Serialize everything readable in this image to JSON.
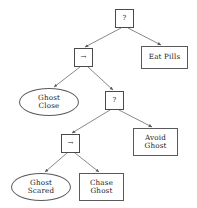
{
  "diagram": {
    "type": "behavior-tree",
    "title": "",
    "nodes": [
      {
        "id": "root-selector",
        "kind": "operator",
        "shape": "box",
        "glyph": "?",
        "glyph_name": "question-mark",
        "lines": [
          "?"
        ],
        "x": 115,
        "y": 9,
        "w": 19,
        "h": 19
      },
      {
        "id": "sequence-1",
        "kind": "operator",
        "shape": "box",
        "glyph": "→",
        "glyph_name": "right-arrow",
        "lines": [
          "→"
        ],
        "x": 74,
        "y": 48,
        "w": 19,
        "h": 19
      },
      {
        "id": "eat-pills",
        "kind": "action",
        "shape": "rect",
        "lines": [
          "Eat Pills"
        ],
        "x": 141,
        "y": 46,
        "w": 47,
        "h": 23
      },
      {
        "id": "ghost-close",
        "kind": "condition",
        "shape": "ellipse",
        "lines": [
          "Ghost",
          "Close"
        ],
        "x": 19,
        "y": 88,
        "w": 60,
        "h": 28
      },
      {
        "id": "selector-2",
        "kind": "operator",
        "shape": "box",
        "glyph": "?",
        "glyph_name": "question-mark",
        "lines": [
          "?"
        ],
        "x": 105,
        "y": 91,
        "w": 19,
        "h": 19
      },
      {
        "id": "sequence-2",
        "kind": "operator",
        "shape": "box",
        "glyph": "→",
        "glyph_name": "right-arrow",
        "lines": [
          "→"
        ],
        "x": 61,
        "y": 134,
        "w": 19,
        "h": 19
      },
      {
        "id": "avoid-ghost",
        "kind": "action",
        "shape": "rect",
        "lines": [
          "Avoid",
          "Ghost"
        ],
        "x": 133,
        "y": 128,
        "w": 45,
        "h": 28
      },
      {
        "id": "ghost-scared",
        "kind": "condition",
        "shape": "ellipse",
        "lines": [
          "Ghost",
          "Scared"
        ],
        "x": 11,
        "y": 173,
        "w": 60,
        "h": 28
      },
      {
        "id": "chase-ghost",
        "kind": "action",
        "shape": "rect",
        "lines": [
          "Chase",
          "Ghost"
        ],
        "x": 79,
        "y": 173,
        "w": 45,
        "h": 28
      }
    ],
    "edges": [
      {
        "from": "root-selector",
        "to": "sequence-1",
        "x1": 121,
        "y1": 28,
        "x2": 85,
        "y2": 47
      },
      {
        "from": "root-selector",
        "to": "eat-pills",
        "x1": 128,
        "y1": 28,
        "x2": 161,
        "y2": 45
      },
      {
        "from": "sequence-1",
        "to": "ghost-close",
        "x1": 80,
        "y1": 67,
        "x2": 54,
        "y2": 87
      },
      {
        "from": "sequence-1",
        "to": "selector-2",
        "x1": 88,
        "y1": 67,
        "x2": 113,
        "y2": 90
      },
      {
        "from": "selector-2",
        "to": "sequence-2",
        "x1": 110,
        "y1": 110,
        "x2": 72,
        "y2": 133
      },
      {
        "from": "selector-2",
        "to": "avoid-ghost",
        "x1": 119,
        "y1": 110,
        "x2": 152,
        "y2": 127
      },
      {
        "from": "sequence-2",
        "to": "ghost-scared",
        "x1": 67,
        "y1": 153,
        "x2": 45,
        "y2": 172
      },
      {
        "from": "sequence-2",
        "to": "chase-ghost",
        "x1": 75,
        "y1": 153,
        "x2": 99,
        "y2": 172
      }
    ],
    "colors": {
      "background": "#ffffff",
      "stroke": "#5a5a5a",
      "edge": "#6a6a6a",
      "text": "#1a1a1a"
    }
  }
}
